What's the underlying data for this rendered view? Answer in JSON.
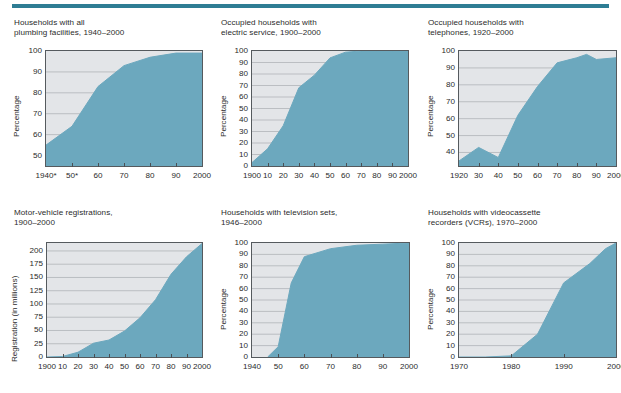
{
  "page": {
    "accent_color": "#2E7D94",
    "fill_color": "#6CA8BE",
    "plot_bg_color": "#E3E5E8",
    "gridline_color": "#A9ADB2",
    "axis_color": "#555A5E",
    "text_color": "#2B2B2B"
  },
  "charts": [
    {
      "id": "plumbing",
      "title": "Households with all\nplumbing facilities, 1940–2000",
      "ylabel": "Percentage",
      "yticks": [
        "100",
        "90",
        "80",
        "70",
        "60",
        "50"
      ],
      "xticks": [
        "1940*",
        "50*",
        "60",
        "70",
        "80",
        "90",
        "2000"
      ],
      "chart_data": {
        "type": "area",
        "title": "Households with all plumbing facilities, 1940–2000",
        "xlabel": "",
        "ylabel": "Percentage",
        "xlim": [
          1940,
          2000
        ],
        "ylim": [
          45,
          100
        ],
        "grid": true,
        "x": [
          1940,
          1950,
          1960,
          1970,
          1980,
          1990,
          2000
        ],
        "values": [
          55,
          64,
          83,
          93,
          97,
          99,
          99
        ]
      }
    },
    {
      "id": "electric",
      "title": "Occupied households with\nelectric service, 1900–2000",
      "ylabel": "Percentage",
      "yticks": [
        "100",
        "90",
        "80",
        "70",
        "60",
        "50",
        "40",
        "30",
        "20",
        "10",
        "0"
      ],
      "xticks": [
        "1900",
        "10",
        "20",
        "30",
        "40",
        "50",
        "60",
        "70",
        "80",
        "90",
        "2000"
      ],
      "chart_data": {
        "type": "area",
        "title": "Occupied households with electric service, 1900–2000",
        "xlabel": "",
        "ylabel": "Percentage",
        "xlim": [
          1900,
          2000
        ],
        "ylim": [
          0,
          100
        ],
        "grid": true,
        "x": [
          1900,
          1910,
          1920,
          1930,
          1940,
          1950,
          1960,
          1970,
          1980,
          1990,
          2000
        ],
        "values": [
          3,
          15,
          35,
          68,
          79,
          94,
          99,
          100,
          100,
          100,
          100
        ]
      }
    },
    {
      "id": "telephones",
      "title": "Occupied households with\ntelephones, 1920–2000",
      "ylabel": "Percentage",
      "yticks": [
        "100",
        "90",
        "80",
        "70",
        "60",
        "50",
        "40"
      ],
      "xticks": [
        "1920",
        "30",
        "40",
        "50",
        "60",
        "70",
        "80",
        "90",
        "2000"
      ],
      "chart_data": {
        "type": "area",
        "title": "Occupied households with telephones, 1920–2000",
        "xlabel": "",
        "ylabel": "Percentage",
        "xlim": [
          1920,
          2000
        ],
        "ylim": [
          32,
          100
        ],
        "grid": true,
        "x": [
          1920,
          1930,
          1940,
          1950,
          1960,
          1970,
          1980,
          1985,
          1990,
          2000
        ],
        "values": [
          35,
          43,
          37,
          62,
          79,
          93,
          96,
          98,
          95,
          96
        ]
      }
    },
    {
      "id": "motor-vehicles",
      "title": "Motor-vehicle registrations,\n1900–2000",
      "ylabel": "Registration (in millions)",
      "yticks": [
        "200",
        "175",
        "150",
        "125",
        "100",
        "75",
        "50",
        "25",
        "0"
      ],
      "xticks": [
        "1900",
        "10",
        "20",
        "30",
        "40",
        "50",
        "60",
        "70",
        "80",
        "90",
        "2000"
      ],
      "chart_data": {
        "type": "area",
        "title": "Motor-vehicle registrations, 1900–2000",
        "xlabel": "",
        "ylabel": "Registration (in millions)",
        "xlim": [
          1900,
          2000
        ],
        "ylim": [
          0,
          215
        ],
        "grid": true,
        "x": [
          1900,
          1910,
          1920,
          1930,
          1940,
          1950,
          1960,
          1970,
          1980,
          1990,
          2000
        ],
        "values": [
          0,
          1,
          9,
          26,
          32,
          49,
          74,
          108,
          156,
          189,
          214
        ]
      }
    },
    {
      "id": "television",
      "title": "Households with television sets,\n1946–2000",
      "ylabel": "Percentage",
      "yticks": [
        "100",
        "90",
        "80",
        "70",
        "60",
        "50",
        "40",
        "30",
        "20",
        "10",
        "0"
      ],
      "xticks": [
        "1940",
        "50",
        "60",
        "70",
        "80",
        "90",
        "2000"
      ],
      "chart_data": {
        "type": "area",
        "title": "Households with television sets, 1946–2000",
        "xlabel": "",
        "ylabel": "Percentage",
        "xlim": [
          1940,
          2000
        ],
        "ylim": [
          0,
          100
        ],
        "grid": true,
        "x": [
          1946,
          1950,
          1955,
          1960,
          1970,
          1980,
          1990,
          2000
        ],
        "values": [
          0,
          9,
          65,
          88,
          95,
          98,
          99,
          100
        ]
      }
    },
    {
      "id": "vcr",
      "title": "Households with videocassette\nrecorders (VCRs), 1970–2000",
      "ylabel": "Percentage",
      "yticks": [
        "100",
        "90",
        "80",
        "70",
        "60",
        "50",
        "40",
        "30",
        "20",
        "10",
        "0"
      ],
      "xticks": [
        "1970",
        "1980",
        "1990",
        "2000"
      ],
      "chart_data": {
        "type": "area",
        "title": "Households with videocassette recorders (VCRs), 1970–2000",
        "xlabel": "",
        "ylabel": "Percentage",
        "xlim": [
          1970,
          2000
        ],
        "ylim": [
          0,
          100
        ],
        "grid": true,
        "x": [
          1970,
          1975,
          1980,
          1985,
          1990,
          1995,
          1998,
          2000
        ],
        "values": [
          0,
          0,
          1,
          20,
          65,
          82,
          95,
          100
        ]
      }
    }
  ]
}
